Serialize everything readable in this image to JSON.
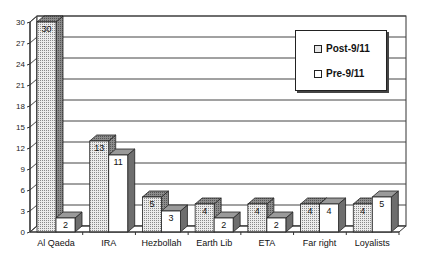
{
  "chart_data": {
    "type": "bar",
    "title": "",
    "xlabel": "",
    "ylabel": "",
    "ylim": [
      0,
      30
    ],
    "yticks": [
      0,
      3,
      6,
      9,
      12,
      15,
      18,
      21,
      24,
      27,
      30
    ],
    "categories": [
      "Al Qaeda",
      "IRA",
      "Hezbollah",
      "Earth Lib",
      "ETA",
      "Far right",
      "Loyalists"
    ],
    "series": [
      {
        "name": "Post-9/11",
        "values": [
          30,
          13,
          5,
          4,
          4,
          4,
          4
        ],
        "pattern": "dotted",
        "color": "#e6e6e6"
      },
      {
        "name": "Pre-9/11",
        "values": [
          2,
          11,
          3,
          2,
          2,
          4,
          5
        ],
        "pattern": "solid",
        "color": "#ffffff"
      }
    ],
    "grid": true,
    "legend_position": "upper-right-inside",
    "style": "3d-clustered-column"
  },
  "legend": {
    "items": [
      {
        "label": "Post-9/11",
        "swatch": "dotted"
      },
      {
        "label": "Pre-9/11",
        "swatch": "solid"
      }
    ]
  },
  "colors": {
    "axis": "#333333",
    "grid": "#444444",
    "side_face": "#6e6e6e",
    "top_face": "#9a9a9a",
    "dot": "#777777"
  }
}
